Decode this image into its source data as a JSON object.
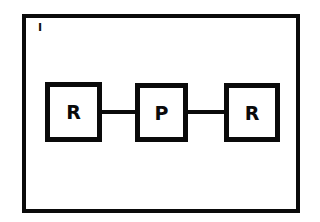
{
  "diagram": {
    "panel_label": "I",
    "nodes": [
      {
        "id": "n1",
        "label": "R"
      },
      {
        "id": "n2",
        "label": "P"
      },
      {
        "id": "n3",
        "label": "R"
      }
    ],
    "edges": [
      {
        "from": "n1",
        "to": "n2"
      },
      {
        "from": "n2",
        "to": "n3"
      }
    ],
    "colors": {
      "stroke": "#0a0a0a",
      "background": "#ffffff"
    }
  }
}
